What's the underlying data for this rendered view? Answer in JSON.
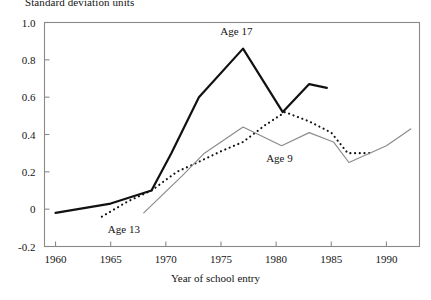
{
  "chart_data": {
    "type": "line",
    "title": "",
    "ylabel": "Standard deviation units",
    "xlabel": "Year of school entry",
    "xlim": [
      1959,
      1993
    ],
    "ylim": [
      -0.2,
      1.0
    ],
    "grid": false,
    "legend_position": "inline-annotations",
    "yticks": [
      "1.0",
      "0.8",
      "0.6",
      "0.4",
      "0.2",
      "0",
      "-0.2"
    ],
    "ytick_values": [
      1.0,
      0.8,
      0.6,
      0.4,
      0.2,
      0,
      -0.2
    ],
    "xticks": [
      "1960",
      "1965",
      "1970",
      "1975",
      "1980",
      "1985",
      "1990"
    ],
    "xtick_values": [
      1960,
      1965,
      1970,
      1975,
      1980,
      1985,
      1990
    ],
    "series": [
      {
        "name": "Age 17",
        "style": "solid-thick-black",
        "color": "#111111",
        "label_x": 1976.4,
        "label_y": 0.955,
        "x": [
          1960.0,
          1965.0,
          1968.7,
          1970.5,
          1973.0,
          1977.0,
          1980.6,
          1983.0,
          1984.6
        ],
        "values": [
          -0.02,
          0.03,
          0.1,
          0.3,
          0.6,
          0.86,
          0.52,
          0.67,
          0.65
        ]
      },
      {
        "name": "Age 13",
        "style": "dotted-black",
        "color": "#111111",
        "label_x": 1966.2,
        "label_y": -0.105,
        "x": [
          1964.2,
          1966.5,
          1968.7,
          1971.0,
          1972.5,
          1975.0,
          1977.0,
          1979.0,
          1980.8,
          1983.0,
          1985.0,
          1986.5,
          1988.8
        ],
        "values": [
          -0.04,
          0.04,
          0.1,
          0.2,
          0.24,
          0.31,
          0.36,
          0.45,
          0.52,
          0.47,
          0.41,
          0.3,
          0.3
        ]
      },
      {
        "name": "Age 9",
        "style": "solid-thin-gray",
        "color": "#8c8c8c",
        "label_x": 1980.3,
        "label_y": 0.275,
        "x": [
          1968.0,
          1971.5,
          1973.5,
          1977.0,
          1980.5,
          1983.0,
          1985.2,
          1986.6,
          1990.0,
          1992.2
        ],
        "values": [
          -0.02,
          0.18,
          0.3,
          0.44,
          0.34,
          0.41,
          0.36,
          0.25,
          0.34,
          0.43
        ]
      }
    ]
  },
  "axis": {
    "ylabel_top": "Standard deviation units",
    "xlabel_bottom": "Year of school entry"
  }
}
